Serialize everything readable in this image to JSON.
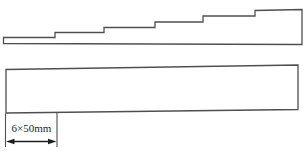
{
  "figure": {
    "type": "technical-diagram",
    "dimension_label": "6×50mm",
    "top_shape": {
      "name": "stepped-strip",
      "plateau_count": 6
    },
    "bottom_shape": {
      "name": "plain-strip"
    },
    "dimension": {
      "segment_width_mm": 50,
      "segment_count": 6
    },
    "colors": {
      "line": "#4f4f4f",
      "arrow": "#1f1f1f",
      "background": "#ffffff",
      "text": "#1f1f1f"
    }
  }
}
